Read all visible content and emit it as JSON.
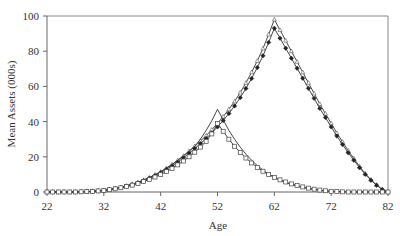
{
  "chart_data": {
    "type": "line",
    "title": "",
    "xlabel": "Age",
    "ylabel": "Mean Assets (000s)",
    "xlim": [
      22,
      82
    ],
    "ylim": [
      0,
      100
    ],
    "xticks": [
      22,
      32,
      42,
      52,
      62,
      72,
      82
    ],
    "yticks": [
      0,
      20,
      40,
      60,
      80,
      100
    ],
    "grid": false,
    "legend": "none",
    "x": [
      22,
      23,
      24,
      25,
      26,
      27,
      28,
      29,
      30,
      31,
      32,
      33,
      34,
      35,
      36,
      37,
      38,
      39,
      40,
      41,
      42,
      43,
      44,
      45,
      46,
      47,
      48,
      49,
      50,
      51,
      52,
      53,
      54,
      55,
      56,
      57,
      58,
      59,
      60,
      61,
      62,
      63,
      64,
      65,
      66,
      67,
      68,
      69,
      70,
      71,
      72,
      73,
      74,
      75,
      76,
      77,
      78,
      79,
      80,
      81,
      82
    ],
    "series": [
      {
        "name": "Series 1 (retire 62, plain)",
        "marker": "triangle-open",
        "values": [
          0,
          0,
          0,
          0,
          0,
          0,
          0.1,
          0.2,
          0.4,
          0.7,
          1.0,
          1.5,
          2.0,
          2.7,
          3.5,
          4.4,
          5.5,
          6.8,
          8.2,
          9.8,
          11.5,
          13.5,
          15.6,
          18,
          20.5,
          23.2,
          26,
          29,
          32,
          35.4,
          39,
          42.8,
          47,
          51.5,
          56.5,
          62,
          68,
          74.5,
          81.5,
          89.5,
          98,
          92,
          86,
          80,
          74,
          68,
          62,
          56,
          50,
          44.5,
          39,
          33.5,
          28.5,
          23.5,
          19,
          14.5,
          10.5,
          7,
          4,
          1.5,
          0
        ]
      },
      {
        "name": "Series 2 (retire 62, diamonds)",
        "marker": "diamond-filled",
        "values": [
          0,
          0,
          0,
          0,
          0,
          0,
          0.1,
          0.2,
          0.4,
          0.6,
          0.9,
          1.4,
          1.9,
          2.5,
          3.3,
          4.2,
          5.2,
          6.4,
          7.8,
          9.3,
          11,
          12.8,
          14.8,
          17,
          19.4,
          22,
          24.7,
          27.5,
          30.4,
          33.6,
          37,
          40.6,
          44.6,
          48.9,
          53.6,
          58.8,
          64.5,
          70.7,
          77.4,
          85,
          93,
          87.4,
          81.7,
          76,
          70.3,
          64.6,
          58.9,
          53.2,
          47.5,
          42.3,
          37,
          31.8,
          27,
          22.3,
          18,
          13.8,
          10,
          6.7,
          3.8,
          1.4,
          0
        ]
      },
      {
        "name": "Series 3 (retire 51, plain)",
        "marker": "none",
        "values": [
          0,
          0,
          0,
          0,
          0,
          0,
          0.1,
          0.2,
          0.4,
          0.7,
          1.0,
          1.5,
          2.0,
          2.7,
          3.5,
          4.4,
          5.5,
          6.8,
          8.2,
          9.8,
          11.5,
          13.5,
          15.6,
          18,
          20.5,
          23.2,
          26,
          30,
          35,
          40.5,
          47,
          41,
          35,
          30,
          25.5,
          21.5,
          18,
          15,
          12.5,
          10.2,
          8.3,
          6.7,
          5.3,
          4.2,
          3.3,
          2.5,
          1.9,
          1.4,
          1,
          0.7,
          0.5,
          0.3,
          0.2,
          0.1,
          0,
          0,
          0,
          0,
          0,
          0,
          0
        ]
      },
      {
        "name": "Series 4 (retire 51, squares)",
        "marker": "square-open",
        "values": [
          0,
          0,
          0,
          0,
          0,
          0,
          0.1,
          0.2,
          0.4,
          0.6,
          0.9,
          1.3,
          1.8,
          2.4,
          3.1,
          3.9,
          4.8,
          5.9,
          7.1,
          8.5,
          10,
          11.6,
          13.4,
          15.4,
          17.6,
          20,
          22.6,
          25.5,
          28.8,
          33,
          39,
          34.5,
          30,
          26,
          22.5,
          19.3,
          16.5,
          14,
          11.8,
          9.9,
          8.3,
          6.9,
          5.7,
          4.6,
          3.7,
          2.9,
          2.2,
          1.6,
          1.1,
          0.7,
          0.4,
          0.2,
          0.1,
          0,
          0,
          0,
          0,
          0,
          0,
          0,
          0
        ]
      }
    ]
  }
}
